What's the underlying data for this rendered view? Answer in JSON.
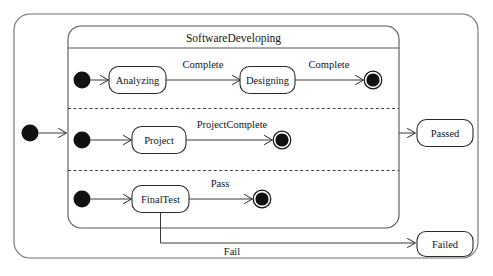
{
  "diagram": {
    "type": "uml-state-machine",
    "composite_state": {
      "name": "SoftwareDeveloping"
    },
    "regions": [
      {
        "id": "region-analysis-design",
        "states": [
          {
            "id": "analyzing",
            "label": "Analyzing"
          },
          {
            "id": "designing",
            "label": "Designing"
          }
        ],
        "transitions": [
          {
            "id": "t-init-analyzing",
            "label": ""
          },
          {
            "id": "t-analyzing-designing",
            "label": "Complete"
          },
          {
            "id": "t-designing-final",
            "label": "Complete"
          }
        ]
      },
      {
        "id": "region-project",
        "states": [
          {
            "id": "project",
            "label": "Project"
          }
        ],
        "transitions": [
          {
            "id": "t-init-project",
            "label": ""
          },
          {
            "id": "t-project-final",
            "label": "ProjectComplete"
          }
        ]
      },
      {
        "id": "region-finaltest",
        "states": [
          {
            "id": "finaltest",
            "label": "FinalTest"
          }
        ],
        "transitions": [
          {
            "id": "t-init-finaltest",
            "label": ""
          },
          {
            "id": "t-finaltest-final",
            "label": "Pass"
          },
          {
            "id": "t-finaltest-failed",
            "label": "Fail"
          }
        ]
      }
    ],
    "outcome_states": [
      {
        "id": "passed",
        "label": "Passed"
      },
      {
        "id": "failed",
        "label": "Failed"
      }
    ],
    "colors": {
      "background": "#ffffff",
      "stroke": "#2b2b2b",
      "outer_stroke": "#6e6e6e",
      "node_fill": "#111111",
      "text": "#151515"
    }
  }
}
